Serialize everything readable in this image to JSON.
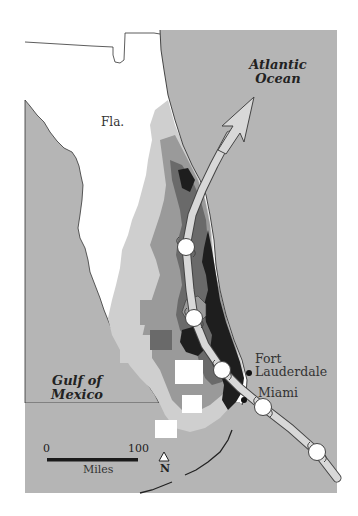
{
  "map": {
    "title_labels": {
      "atlantic": "Atlantic\nOcean",
      "atlantic_line1": "Atlantic",
      "atlantic_line2": "Ocean",
      "gulf_line1": "Gulf of",
      "gulf_line2": "Mexico",
      "state": "Fla."
    },
    "cities": [
      {
        "name_line1": "Fort",
        "name_line2": "Lauderdale",
        "x": 249,
        "y": 373
      },
      {
        "name_line1": "Miami",
        "name_line2": "",
        "x": 244,
        "y": 400
      }
    ],
    "scale_bar": {
      "start": "0",
      "end": "100",
      "unit": "Miles"
    },
    "north_arrow": {
      "label": "N"
    },
    "colors": {
      "water": "#b5b5b5",
      "land": "#ffffff",
      "shade_light": "#cfcfcf",
      "shade_mid": "#9a9a9a",
      "shade_dark": "#6a6a6a",
      "shade_darkest": "#1e1e1e",
      "track_fill": "#d8d8d8",
      "track_stroke": "#444444",
      "storm_marker": "#ffffff"
    },
    "storm_track": {
      "markers": [
        {
          "x": 186,
          "y": 247
        },
        {
          "x": 194,
          "y": 318
        },
        {
          "x": 222,
          "y": 370
        },
        {
          "x": 263,
          "y": 407
        },
        {
          "x": 317,
          "y": 452
        }
      ],
      "direction": "northeast"
    }
  }
}
